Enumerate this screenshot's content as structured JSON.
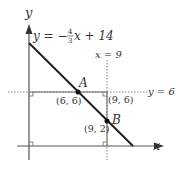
{
  "diagram": {
    "axis_x_label": "x",
    "axis_y_label": "y",
    "line_eq_prefix": "y = −",
    "line_eq_num": "4",
    "line_eq_den": "3",
    "line_eq_suffix": "x + 14",
    "vline_label": "x = 9",
    "hline_label": "y = 6",
    "point_A_label": "A",
    "point_A_coord": "(6, 6)",
    "point_B_label": "B",
    "point_B_coord": "(9, 2)",
    "corner_label": "(9, 6)"
  }
}
